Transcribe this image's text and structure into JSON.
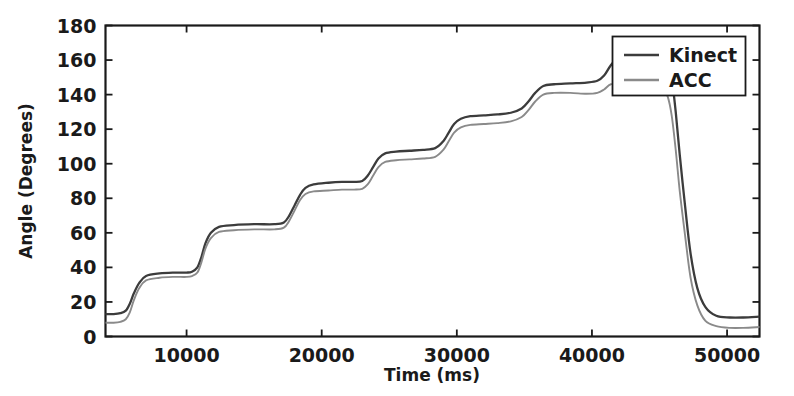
{
  "chart_data": {
    "type": "line",
    "title": "",
    "xlabel": "Time (ms)",
    "ylabel": "Angle (Degrees)",
    "xlim": [
      4000,
      52400
    ],
    "ylim": [
      0,
      180
    ],
    "xticks": [
      10000,
      20000,
      30000,
      40000,
      50000
    ],
    "xtick_labels": [
      "10000",
      "20000",
      "30000",
      "40000",
      "50000"
    ],
    "yticks": [
      0,
      20,
      40,
      60,
      80,
      100,
      120,
      140,
      160,
      180
    ],
    "ytick_labels": [
      "0",
      "20",
      "40",
      "60",
      "80",
      "100",
      "120",
      "140",
      "160",
      "180"
    ],
    "grid": false,
    "legend_position": "upper right",
    "legend_entries": [
      "Kinect",
      "ACC"
    ],
    "series": [
      {
        "name": "Kinect",
        "color": "#3c3c3c",
        "x": [
          4000,
          4600,
          5100,
          5500,
          5800,
          6100,
          6500,
          7000,
          8000,
          9000,
          10000,
          10400,
          10800,
          11100,
          11400,
          11800,
          12400,
          13500,
          15000,
          16500,
          17200,
          17600,
          18000,
          18400,
          18800,
          19400,
          20500,
          21500,
          22400,
          23000,
          23400,
          23800,
          24200,
          24700,
          25500,
          26500,
          27500,
          28400,
          29000,
          29400,
          29800,
          30300,
          31000,
          32000,
          33000,
          34000,
          34800,
          35300,
          35800,
          36400,
          37200,
          38400,
          39600,
          40400,
          40900,
          41400,
          42000,
          43000,
          44000,
          44900,
          45300,
          45600,
          45900,
          46200,
          46500,
          46900,
          47300,
          47800,
          48400,
          49200,
          50200,
          51200,
          52400
        ],
        "y": [
          13,
          13,
          13.5,
          15,
          19,
          25,
          31,
          35,
          36.5,
          37,
          37,
          37.5,
          40,
          46,
          54,
          60,
          63.5,
          64.5,
          65,
          65,
          66,
          70,
          76,
          82,
          86,
          88,
          89,
          89.5,
          89.5,
          90,
          93,
          98,
          103,
          106,
          107,
          107.5,
          108,
          109,
          113,
          118,
          123,
          126,
          127.5,
          128,
          128.5,
          129.5,
          132,
          136,
          141,
          145,
          146,
          146.5,
          147,
          148,
          151,
          157,
          162,
          164,
          164.5,
          164,
          163,
          160,
          150,
          130,
          105,
          75,
          48,
          28,
          17,
          12,
          11,
          11,
          11.5
        ]
      },
      {
        "name": "ACC",
        "color": "#8a8a8a",
        "x": [
          4000,
          4600,
          5100,
          5500,
          5800,
          6100,
          6500,
          7000,
          8000,
          9000,
          10000,
          10400,
          10800,
          11100,
          11400,
          11800,
          12400,
          13500,
          15000,
          16500,
          17200,
          17600,
          18000,
          18400,
          18800,
          19400,
          20500,
          21500,
          22400,
          23000,
          23400,
          23800,
          24200,
          24700,
          25500,
          26500,
          27500,
          28400,
          29000,
          29400,
          29800,
          30300,
          31000,
          32000,
          33000,
          34000,
          34800,
          35300,
          35800,
          36400,
          37200,
          38400,
          39600,
          40400,
          40900,
          41400,
          42000,
          43000,
          44000,
          44900,
          45300,
          45600,
          45900,
          46200,
          46500,
          46900,
          47300,
          47800,
          48400,
          49200,
          50200,
          51200,
          52400
        ],
        "y": [
          8,
          8,
          8.5,
          10,
          14,
          21,
          28,
          32.5,
          34,
          34.5,
          34.5,
          35,
          37,
          43,
          51,
          57,
          60.5,
          61.5,
          62,
          62,
          63,
          67,
          73,
          79,
          82.5,
          84,
          84.5,
          85,
          85,
          85.5,
          88,
          93,
          98,
          101,
          102,
          102.5,
          103,
          104,
          108,
          113,
          118,
          121,
          122.5,
          123,
          123.5,
          124.5,
          127,
          131,
          136,
          140,
          141,
          141,
          140.5,
          141,
          143,
          146,
          145,
          144,
          143.5,
          143,
          142,
          139,
          128,
          108,
          84,
          58,
          34,
          18,
          9,
          6,
          5,
          5,
          5.5
        ]
      }
    ]
  },
  "legend": {
    "items": [
      {
        "label": "Kinect",
        "color": "#3c3c3c"
      },
      {
        "label": "ACC",
        "color": "#8a8a8a"
      }
    ]
  },
  "axes": {
    "x_title": "Time (ms)",
    "y_title": "Angle (Degrees)"
  }
}
